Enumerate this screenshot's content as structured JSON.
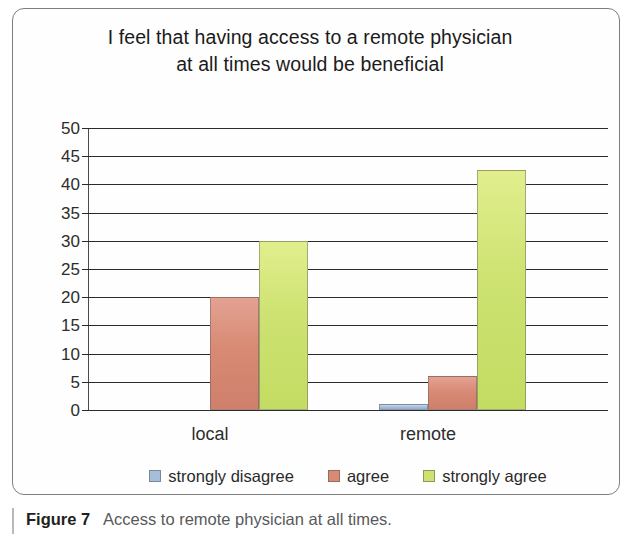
{
  "figure": {
    "caption_label": "Figure 7",
    "caption_text": "Access to remote physician at all times."
  },
  "chart_data": {
    "type": "bar",
    "title": "I feel that having access to a remote physician at all times would be beneficial",
    "title_lines": [
      "I feel that having access to a remote physician",
      "at all times would be beneficial"
    ],
    "xlabel": "",
    "ylabel": "",
    "categories": [
      "local",
      "remote"
    ],
    "series": [
      {
        "name": "strongly disagree",
        "color": "#a6bedb",
        "values": [
          0,
          1
        ]
      },
      {
        "name": "agree",
        "color": "#d88a74",
        "values": [
          20,
          6
        ]
      },
      {
        "name": "strongly agree",
        "color": "#cde271",
        "values": [
          30,
          42.5
        ]
      }
    ],
    "ylim": [
      0,
      50
    ],
    "ytick_step": 5,
    "ytick_labels": [
      "50",
      "45",
      "40",
      "35",
      "30",
      "25",
      "20",
      "15",
      "10",
      "5",
      "0"
    ],
    "ytick_values": [
      50,
      45,
      40,
      35,
      30,
      25,
      20,
      15,
      10,
      5,
      0
    ],
    "grid": true,
    "grid_axis": "y",
    "legend_position": "bottom",
    "legend": [
      "strongly disagree",
      "agree",
      "strongly agree"
    ]
  },
  "colors": {
    "frame_border": "#7e7e80",
    "gridline": "#2b2b2b",
    "axis": "#4a4a4a",
    "text": "#231f20",
    "caption_text": "#58595b",
    "caption_rule": "#b9b9ba",
    "series_strongly_disagree": "#a6bedb",
    "series_agree": "#d88a74",
    "series_strongly_agree": "#cde271"
  }
}
